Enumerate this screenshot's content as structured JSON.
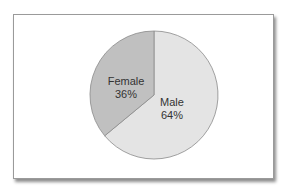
{
  "chart_data": {
    "type": "pie",
    "title": "",
    "categories": [
      "Male",
      "Female"
    ],
    "values": [
      64,
      36
    ],
    "labels": [
      {
        "name": "Male",
        "value_text": "64%"
      },
      {
        "name": "Female",
        "value_text": "36%"
      }
    ],
    "colors": {
      "Male": "#e4e4e4",
      "Female": "#c0c0c0"
    },
    "legend": "none",
    "start_angle": "12 o'clock",
    "direction_female": "counterclockwise from top"
  }
}
